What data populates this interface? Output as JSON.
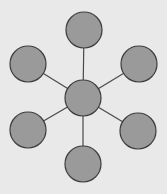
{
  "diagram": {
    "type": "hub-and-spoke",
    "colors": {
      "background": "#e9e9e9",
      "node_fill": "#9a9a9a",
      "node_stroke": "#3c3c3c",
      "edge": "#4a4a4a"
    },
    "hub": {
      "id": "center",
      "cx": 83,
      "cy": 98,
      "r": 18
    },
    "spokes": [
      {
        "id": "top",
        "cx": 84,
        "cy": 30,
        "r": 18
      },
      {
        "id": "top-right",
        "cx": 139,
        "cy": 64,
        "r": 18
      },
      {
        "id": "bottom-right",
        "cx": 138,
        "cy": 131,
        "r": 18
      },
      {
        "id": "bottom",
        "cx": 83,
        "cy": 164,
        "r": 18
      },
      {
        "id": "bottom-left",
        "cx": 28,
        "cy": 130,
        "r": 18
      },
      {
        "id": "top-left",
        "cx": 28,
        "cy": 64,
        "r": 18
      }
    ]
  }
}
